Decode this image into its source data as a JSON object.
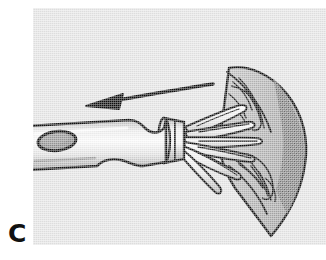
{
  "figure": {
    "panel_label": "C",
    "caption_text": "",
    "kind": "medical-line-illustration"
  },
  "canvas": {
    "width": 326,
    "height": 260,
    "page_background": "#ffffff"
  },
  "panel": {
    "x": 33,
    "y": 8,
    "width": 293,
    "height": 237,
    "background_color": "#e6e6e6",
    "border": "none"
  },
  "palette": {
    "ink": "#111111",
    "plate_gray": "#e6e6e6",
    "tissue_light": "#b5b5b5",
    "tissue_mid": "#9a9a9a",
    "tissue_dark": "#7a7a7a",
    "metal_highlight": "#fbfbfb",
    "metal_shadow": "#a9a9a9",
    "hole_fill": "#8f8f8f"
  },
  "scene": {
    "description": "Surgical instrument with a tubular shaft at left whose tip opens into splayed wire blades that fan out into a triangular tissue flap at right; a curved arrow above points left indicating withdrawal direction.",
    "elements": [
      {
        "name": "instrument-shaft",
        "label": "instrument shaft",
        "note": "tapered tube running from left plate edge to the ferrule; oval side port near the left end, a concave notch on the upper contour and a rounded bulge on the lower contour"
      },
      {
        "name": "shaft-side-port",
        "label": "oval side port",
        "note": "dark elliptical opening on the upper-left of the shaft"
      },
      {
        "name": "instrument-ferrule",
        "label": "collar / ferrule",
        "note": "short banded sleeve at the distal end of the shaft where the blades emerge"
      },
      {
        "name": "fan-wire-blades",
        "label": "splayed wire blades",
        "note": "five to six slender rounded prongs radiating from the ferrule toward the flap"
      },
      {
        "name": "tissue-flap",
        "label": "tissue flap",
        "note": "large triangular fan-shaped sheet of tissue with a darker shaded strip on its right border and fine vein striations"
      },
      {
        "name": "direction-arrow",
        "label": "direction of traction arrow",
        "note": "gently curved arrow above the shaft pointing to the left"
      }
    ]
  }
}
